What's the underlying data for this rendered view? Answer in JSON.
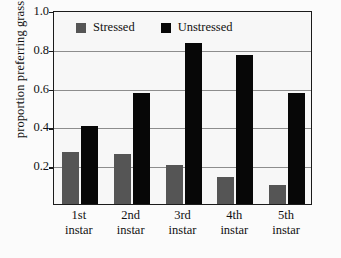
{
  "chart_data": {
    "type": "bar",
    "title": "",
    "xlabel": "",
    "ylabel": "proportion preferring grass",
    "ylim": [
      0,
      1.0
    ],
    "yticks": [
      "0.2",
      "0.4",
      "0.6",
      "0.8",
      "1.0"
    ],
    "ytick_values": [
      0.2,
      0.4,
      0.6,
      0.8,
      1.0
    ],
    "grid": true,
    "legend_position": "top-left inside plot",
    "categories": [
      "1st instar",
      "2nd instar",
      "3rd instar",
      "4th instar",
      "5th instar"
    ],
    "category_lines": [
      [
        "1st",
        "instar"
      ],
      [
        "2nd",
        "instar"
      ],
      [
        "3rd",
        "instar"
      ],
      [
        "4th",
        "instar"
      ],
      [
        "5th",
        "instar"
      ]
    ],
    "series": [
      {
        "name": "Stressed",
        "color": "#555555",
        "values": [
          0.27,
          0.26,
          0.2,
          0.14,
          0.1
        ]
      },
      {
        "name": "Unstressed",
        "color": "#070707",
        "values": [
          0.4,
          0.57,
          0.83,
          0.77,
          0.57
        ]
      }
    ]
  },
  "legend": {
    "items": [
      {
        "label": "Stressed",
        "swatch": "gray-square-swatch"
      },
      {
        "label": "Unstressed",
        "swatch": "black-square-swatch"
      }
    ]
  },
  "axes": {
    "y_title": "proportion preferring grass"
  }
}
